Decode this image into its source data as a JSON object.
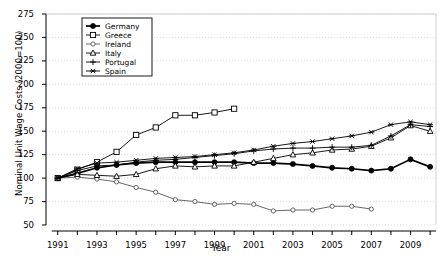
{
  "chart_data": {
    "type": "line",
    "title": "",
    "xlabel": "Year",
    "ylabel": "Nominal Unit Wage Costs (2000=100)",
    "xlim": [
      1990.4,
      2010.3
    ],
    "ylim": [
      50,
      275
    ],
    "yticks": [
      50,
      75,
      100,
      125,
      150,
      175,
      200,
      225,
      250,
      275
    ],
    "xticks": [
      1991,
      1992,
      1993,
      1994,
      1995,
      1996,
      1997,
      1998,
      1999,
      2000,
      2001,
      2002,
      2003,
      2004,
      2005,
      2006,
      2007,
      2008,
      2009,
      2010
    ],
    "xticklabels": [
      "1991",
      "",
      "1993",
      "",
      "1995",
      "",
      "1997",
      "",
      "1999",
      "",
      "2001",
      "",
      "2003",
      "",
      "2005",
      "",
      "2007",
      "",
      "2009",
      ""
    ],
    "grid": "horizontal dotted",
    "legend_position": "top-left inside",
    "x": [
      1991,
      1992,
      1993,
      1994,
      1995,
      1996,
      1997,
      1998,
      1999,
      2000,
      2001,
      2002,
      2003,
      2004,
      2005,
      2006,
      2007,
      2008,
      2009,
      2010
    ],
    "series": [
      {
        "name": "Germany",
        "marker": "filled-circle",
        "values": [
          100,
          105,
          111,
          114,
          116,
          117,
          117,
          117,
          117,
          117,
          116,
          116,
          115,
          113,
          111,
          110,
          108,
          110,
          113,
          120
        ]
      },
      {
        "name": "Greece",
        "marker": "open-square",
        "values": [
          100,
          109,
          117,
          128,
          146,
          154,
          167,
          167,
          170,
          174,
          null,
          null,
          null,
          null,
          null,
          null,
          null,
          null,
          null,
          null
        ]
      },
      {
        "name": "Ireland",
        "marker": "small-filled-square",
        "values": [
          100,
          100,
          100,
          101,
          103,
          104,
          105,
          107,
          109,
          111,
          112,
          113,
          114,
          116,
          117,
          118,
          119,
          120,
          null,
          null
        ]
      },
      {
        "name": "Italy",
        "marker": "open-triangle",
        "values": [
          100,
          102,
          100,
          99,
          100,
          103,
          106,
          105,
          105,
          106,
          108,
          111,
          114,
          116,
          118,
          120,
          123,
          127,
          131,
          137
        ]
      },
      {
        "name": "Portugal",
        "marker": "plus",
        "values": [
          100,
          106,
          111,
          113,
          116,
          118,
          120,
          121,
          123,
          125,
          128,
          131,
          133,
          135,
          136,
          137,
          138,
          141,
          145,
          148
        ]
      },
      {
        "name": "Spain",
        "marker": "asterisk",
        "values": [
          100,
          107,
          113,
          115,
          118,
          119,
          121,
          122,
          124,
          126,
          128,
          131,
          134,
          136,
          138,
          140,
          143,
          148,
          152,
          155
        ]
      }
    ],
    "series_full": {
      "Germany": {
        "1991": 100,
        "1992": 105,
        "1993": 111,
        "1994": 114,
        "1995": 116,
        "1996": 117,
        "1997": 117,
        "1998": 117,
        "1999": 117,
        "2000": 117,
        "2001": 116,
        "2002": 116,
        "2003": 115,
        "2004": 113,
        "2005": 111,
        "2006": 110,
        "2007": 108,
        "2008": 110,
        "2009": 120,
        "2010": 112
      },
      "Greece": {
        "1991": 100,
        "1992": 109,
        "1993": 117,
        "1994": 128,
        "1995": 146,
        "1996": 154,
        "1997": 167,
        "1998": 167,
        "1999": 170,
        "2000": 174,
        "2001": null
      },
      "Ireland": {
        "1991": 100,
        "1992": 101,
        "1993": 99,
        "1994": 96,
        "1995": 90,
        "1996": 85,
        "1997": 77,
        "1998": 75,
        "1999": 72,
        "2000": 73,
        "2001": 72,
        "2002": 65,
        "2003": 66,
        "2004": 66,
        "2005": 70,
        "2006": 70,
        "2007": 67
      },
      "Italy": {
        "1991": 100,
        "1992": 104,
        "1993": 103,
        "1994": 102,
        "1995": 104,
        "1996": 110,
        "1997": 113,
        "1998": 112,
        "1999": 113,
        "2000": 113,
        "2001": 117,
        "2002": 121,
        "2003": 125,
        "2004": 127,
        "2005": 130,
        "2006": 131,
        "2007": 134,
        "2008": 143,
        "2009": 156,
        "2010": 150
      },
      "Portugal": {
        "1991": 100,
        "1992": 108,
        "1993": 113,
        "1994": 114,
        "1995": 117,
        "1996": 119,
        "1997": 120,
        "1998": 122,
        "1999": 124,
        "2000": 126,
        "2001": 129,
        "2002": 131,
        "2003": 132,
        "2004": 132,
        "2005": 133,
        "2006": 133,
        "2007": 135,
        "2008": 145,
        "2009": 157,
        "2010": 155
      },
      "Spain": {
        "1991": 100,
        "1992": 110,
        "1993": 116,
        "1994": 117,
        "1995": 119,
        "1996": 121,
        "1997": 122,
        "1998": 123,
        "1999": 125,
        "2000": 127,
        "2001": 130,
        "2002": 134,
        "2003": 137,
        "2004": 139,
        "2005": 142,
        "2006": 145,
        "2007": 149,
        "2008": 157,
        "2009": 160,
        "2010": 157
      }
    },
    "legend": [
      "Germany",
      "Greece",
      "Ireland",
      "Italy",
      "Portugal",
      "Spain"
    ],
    "colors": {
      "line": "#000000",
      "grid": "#cccccc",
      "frame": "#000000",
      "background": "#ffffff"
    }
  },
  "axis": {
    "ylabel": "Nominal Unit Wage Costs (2000=100)",
    "xlabel": "Year"
  }
}
